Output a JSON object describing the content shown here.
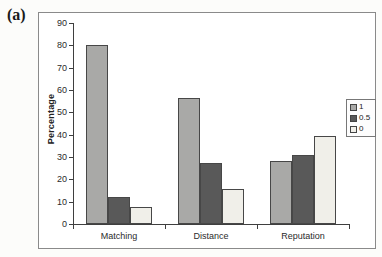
{
  "figure": {
    "panel_label": "(a)"
  },
  "chart_data": {
    "type": "bar",
    "title": "",
    "xlabel": "",
    "ylabel": "Percentage",
    "categories": [
      "Matching",
      "Distance",
      "Reputation"
    ],
    "series": [
      {
        "name": "1",
        "color": "#a9a9a7",
        "values": [
          80,
          56.5,
          28
        ]
      },
      {
        "name": "0.5",
        "color": "#595959",
        "values": [
          12,
          27.5,
          31
        ]
      },
      {
        "name": "0",
        "color": "#f0efe9",
        "values": [
          7.5,
          15.5,
          39.5
        ]
      }
    ],
    "ylim": [
      0,
      90
    ],
    "ytick_step": 10,
    "grid": false,
    "legend_position": "right",
    "colors": {
      "axis": "#3f3f3f",
      "frame_border": "#8a8a8a",
      "background": "#ffffff"
    }
  }
}
